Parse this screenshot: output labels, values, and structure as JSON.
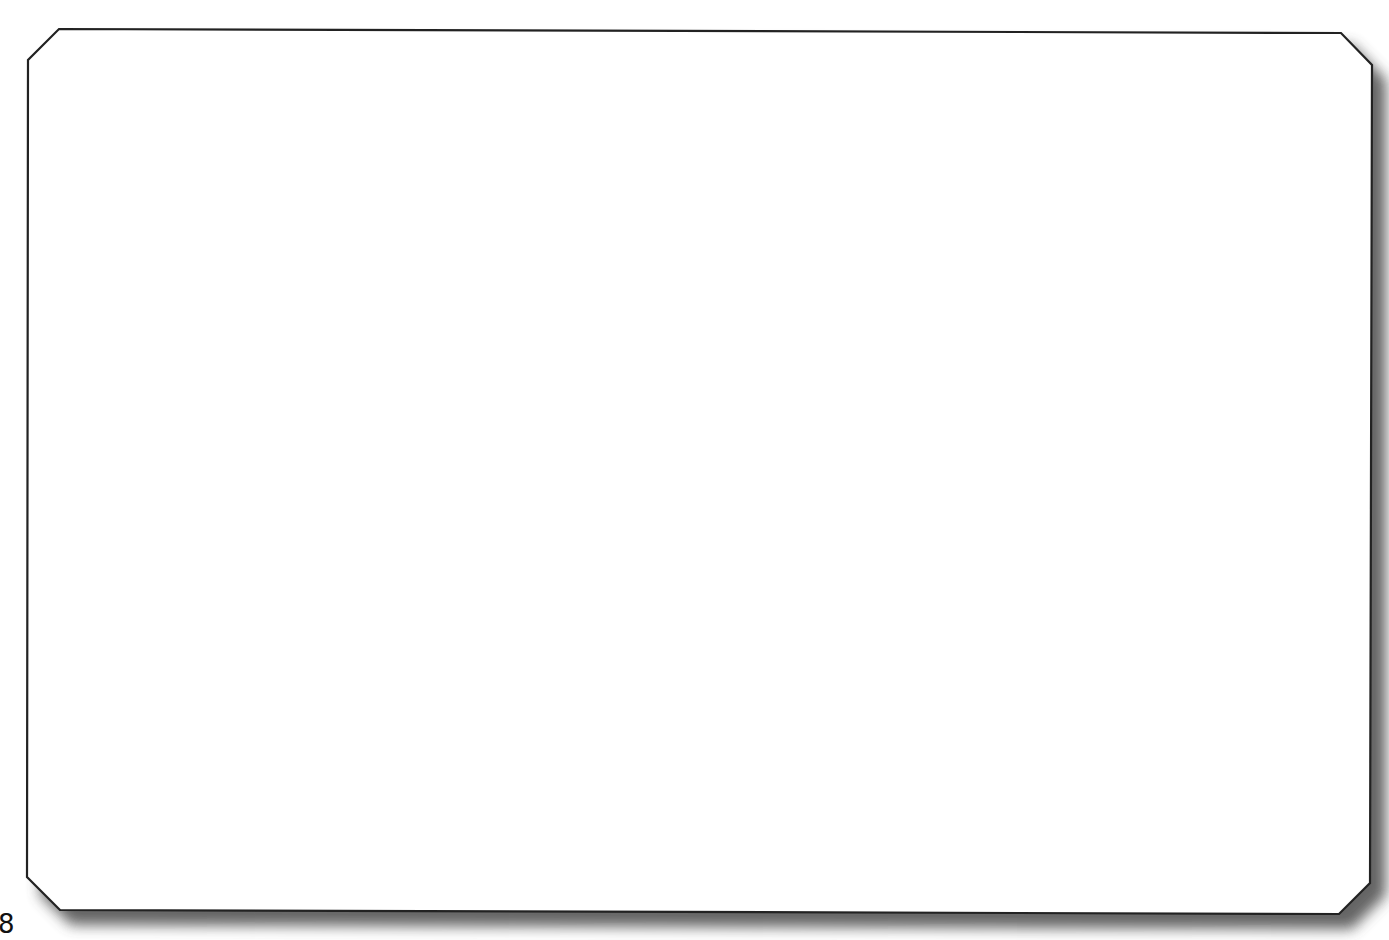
{
  "page": {
    "page_number": "8"
  },
  "frame": {
    "shape": "chamfered-rectangle",
    "fill_color": "#ffffff",
    "stroke_color": "#222222",
    "shadow_color": "#555555",
    "content": ""
  }
}
